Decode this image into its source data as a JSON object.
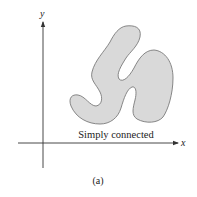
{
  "figure": {
    "axes": {
      "x_label": "x",
      "y_label": "y"
    },
    "region": {
      "label": "Simply connected",
      "fill": "#d9d9d9",
      "stroke": "#7a7a7a"
    },
    "caption": "(a)"
  }
}
